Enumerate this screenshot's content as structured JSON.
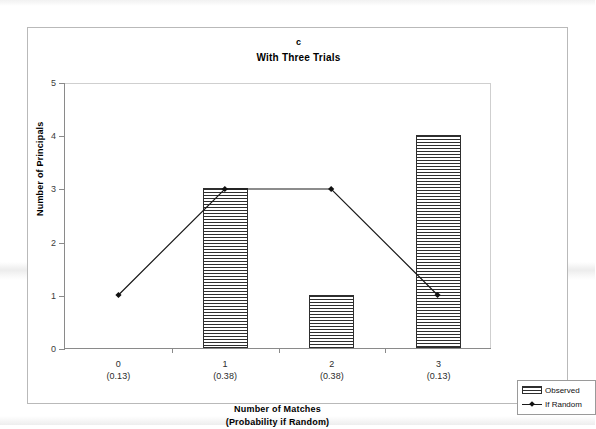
{
  "chart_data": {
    "type": "bar",
    "panel_label": "c",
    "title": "With Three Trials",
    "xlabel": "Number of Matches",
    "xlabel_sub": "(Probability if Random)",
    "ylabel": "Number of Principals",
    "ylim": [
      0,
      5
    ],
    "yticks": [
      0,
      1,
      2,
      3,
      4,
      5
    ],
    "ytick_labels": [
      "0",
      "1",
      "2",
      "3",
      "4",
      "5"
    ],
    "grid": false,
    "legend_position": "bottom-right-outside",
    "categories": [
      "0",
      "1",
      "2",
      "3"
    ],
    "category_probabilities": [
      "(0.13)",
      "(0.38)",
      "(0.38)",
      "(0.13)"
    ],
    "series": [
      {
        "name": "Observed",
        "type": "bar",
        "values": [
          0,
          3,
          1,
          4
        ]
      },
      {
        "name": "If Random",
        "type": "line",
        "marker": "diamond",
        "values": [
          1,
          3,
          3,
          1
        ]
      }
    ],
    "legend": [
      {
        "label": "Observed",
        "swatch": "hatched-bar"
      },
      {
        "label": "If Random",
        "swatch": "line-diamond"
      }
    ],
    "colors": {
      "bar_border": "#2e2e2e",
      "bar_hatch": "#2f2f2f",
      "bar_fill": "#ffffff",
      "line": "#1a1a1a",
      "marker": "#111111",
      "axis": "#8a8a8a",
      "frame": "#b9b9b9",
      "text": "#000000",
      "background": "#ffffff"
    }
  }
}
